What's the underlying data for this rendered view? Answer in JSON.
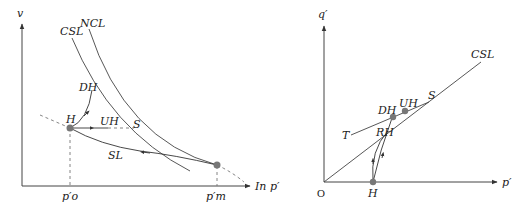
{
  "left_panel": {
    "y_axis_label": "v",
    "x_axis_label": "In p′",
    "curves": {
      "csl": "CSL",
      "ncl": "NCL"
    },
    "paths": {
      "dh": "DH",
      "uh": "UH",
      "sl": "SL"
    },
    "points": {
      "h": "H",
      "s": "S"
    },
    "ticks": {
      "p_o": "p′o",
      "p_m": "p′m"
    }
  },
  "right_panel": {
    "y_axis_label": "q′",
    "x_axis_label": "p′",
    "origin_label": "O",
    "line_label": "CSL",
    "points": {
      "h": "H",
      "rh": "RH",
      "dh": "DH",
      "uh": "UH",
      "s": "S",
      "t": "T"
    }
  },
  "colors": {
    "line": "#444444",
    "point": "#777777",
    "dashed": "#777777"
  }
}
